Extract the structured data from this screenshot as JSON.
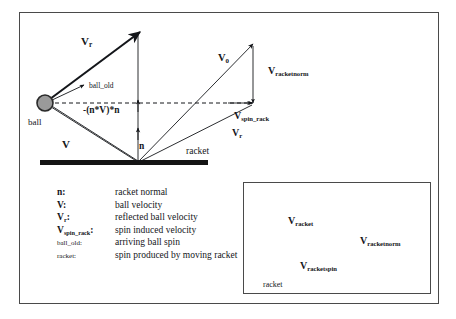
{
  "figure": {
    "type": "vector-diagram",
    "background_color": "#ffffff",
    "line_color": "#14161a",
    "ball_fill_color": "#9a9a9a",
    "racket_color": "#141414",
    "frame_color": "#4a4a4a"
  },
  "main_diagram": {
    "labels": {
      "v_reflected_left": {
        "base": "V",
        "sub": "r"
      },
      "ball_old": "ball_old",
      "ball": "ball",
      "projection": "-(n*V)*n",
      "v_ball": "V",
      "normal": "n",
      "racket": "racket",
      "v_zero": {
        "base": "V",
        "sub": "0"
      },
      "v_racketnorm": {
        "base": "V",
        "sub": "racketnorm"
      },
      "v_spin_rack": {
        "base": "V",
        "sub": "spin_rack"
      },
      "v_reflected_right": {
        "base": "V",
        "sub": "r"
      }
    }
  },
  "legend": {
    "rows": [
      {
        "symbol": "n",
        "symbol_sub": "",
        "separator": ":",
        "description": "racket normal",
        "light": false
      },
      {
        "symbol": "V",
        "symbol_sub": "",
        "separator": ":",
        "description": "ball velocity",
        "light": false
      },
      {
        "symbol": "V",
        "symbol_sub": "r",
        "separator": ":",
        "description": "reflected ball velocity",
        "light": false
      },
      {
        "symbol": "V",
        "symbol_sub": "spin_rack",
        "separator": ":",
        "description": "spin induced velocity",
        "light": false
      },
      {
        "symbol": "ball_old",
        "symbol_sub": "",
        "separator": ":",
        "description": "arriving ball spin",
        "light": true
      },
      {
        "symbol": "racket",
        "symbol_sub": "",
        "separator": ":",
        "description": "spin produced by moving racket",
        "light": true
      }
    ]
  },
  "inset": {
    "labels": {
      "v_racket": {
        "base": "V",
        "sub": "racket"
      },
      "v_racketnorm": {
        "base": "V",
        "sub": "racketnorm"
      },
      "v_racketspin": {
        "base": "V",
        "sub": "racketspin"
      },
      "racket": "racket"
    }
  }
}
